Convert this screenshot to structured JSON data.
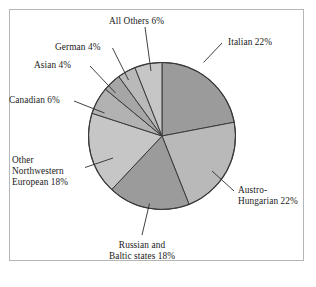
{
  "figure": {
    "background_color": "#ffffff",
    "frame_color": "#b6b6b6"
  },
  "chart_data": {
    "type": "pie",
    "title": "",
    "subtitle": "",
    "xlabel": "",
    "ylabel": "",
    "legend_position": "none",
    "grid": false,
    "start_angle_deg": 90,
    "direction": "clockwise",
    "units": "percent",
    "total": 100,
    "categories": [
      "Italian",
      "Austro-Hungarian",
      "Russian and Baltic states",
      "Other Northwestern European",
      "Canadian",
      "Asian",
      "German",
      "All Others"
    ],
    "values": [
      22,
      22,
      18,
      18,
      6,
      4,
      4,
      6
    ],
    "colors": [
      "#9b9b9b",
      "#b9b9b9",
      "#9b9b9b",
      "#c6c6c6",
      "#b2b2b2",
      "#a6a6a6",
      "#b9b9b9",
      "#c6c6c6"
    ],
    "slice_edge_color": "#3a3a3a",
    "labels": [
      {
        "key": "italian",
        "text": "Italian 22%",
        "value": 22
      },
      {
        "key": "austro_hungarian",
        "text": "Austro-\nHungarian 22%",
        "value": 22
      },
      {
        "key": "russian_baltic",
        "text": "Russian and\nBaltic states 18%",
        "value": 18
      },
      {
        "key": "other_nw_european",
        "text": "Other\nNorthwestern\nEuropean 18%",
        "value": 18
      },
      {
        "key": "canadian",
        "text": "Canadian 6%",
        "value": 6
      },
      {
        "key": "asian",
        "text": "Asian 4%",
        "value": 4
      },
      {
        "key": "german",
        "text": "German 4%",
        "value": 4
      },
      {
        "key": "all_others",
        "text": "All Others 6%",
        "value": 6
      }
    ]
  }
}
